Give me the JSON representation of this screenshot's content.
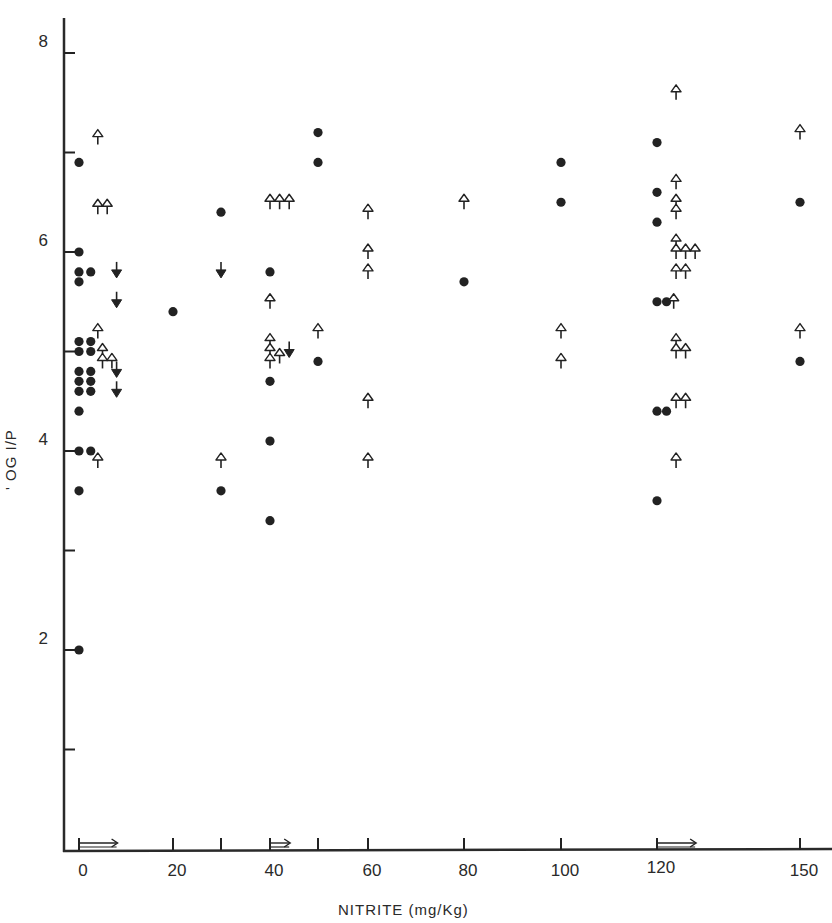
{
  "chart_data": {
    "type": "scatter",
    "title": "",
    "xlabel": "NITRITE (mg/Kg)",
    "ylabel": "' OG I/P",
    "xlim": [
      -3,
      157
    ],
    "ylim": [
      0,
      8.3
    ],
    "grid": false,
    "legend": null,
    "x_ticks": [
      0,
      20,
      30,
      40,
      50,
      60,
      80,
      100,
      120,
      150
    ],
    "x_tick_labels": [
      "0",
      "20",
      "",
      "40",
      "",
      "60",
      "80",
      "100",
      "120",
      "150"
    ],
    "y_ticks": [
      1,
      2,
      3,
      4,
      5,
      6,
      7,
      8
    ],
    "y_tick_labels": [
      "",
      "2",
      "",
      "4",
      "",
      "6",
      "",
      "8"
    ],
    "baseline_arrows": [
      {
        "from": 0,
        "to": 8
      },
      {
        "from": 40,
        "to": 44
      },
      {
        "from": 120,
        "to": 128
      }
    ],
    "series": [
      {
        "name": "filled circles",
        "marker": "filled-circle",
        "points": [
          [
            0,
            6.9
          ],
          [
            0,
            6.0
          ],
          [
            0,
            5.8
          ],
          [
            0,
            5.7
          ],
          [
            0,
            5.1
          ],
          [
            0,
            5.0
          ],
          [
            0,
            4.8
          ],
          [
            0,
            4.7
          ],
          [
            0,
            4.6
          ],
          [
            0,
            4.4
          ],
          [
            0,
            4.0
          ],
          [
            0,
            3.6
          ],
          [
            0,
            2.0
          ],
          [
            2.5,
            5.8
          ],
          [
            2.5,
            5.1
          ],
          [
            2.5,
            5.0
          ],
          [
            2.5,
            4.8
          ],
          [
            2.5,
            4.7
          ],
          [
            2.5,
            4.6
          ],
          [
            2.5,
            4.0
          ],
          [
            20,
            5.4
          ],
          [
            30,
            6.4
          ],
          [
            30,
            3.6
          ],
          [
            40,
            5.8
          ],
          [
            40,
            4.7
          ],
          [
            40,
            4.1
          ],
          [
            40,
            3.3
          ],
          [
            50,
            7.2
          ],
          [
            50,
            6.9
          ],
          [
            50,
            4.9
          ],
          [
            80,
            5.7
          ],
          [
            100,
            6.9
          ],
          [
            100,
            6.5
          ],
          [
            120,
            7.1
          ],
          [
            120,
            6.6
          ],
          [
            120,
            6.3
          ],
          [
            120,
            5.5
          ],
          [
            122,
            5.5
          ],
          [
            120,
            4.4
          ],
          [
            122,
            4.4
          ],
          [
            120,
            3.5
          ],
          [
            150,
            6.5
          ],
          [
            150,
            4.9
          ]
        ]
      },
      {
        "name": "open up-arrows",
        "marker": "open-up-arrow",
        "points": [
          [
            4,
            7.15
          ],
          [
            4,
            6.45
          ],
          [
            6,
            6.45
          ],
          [
            4,
            5.2
          ],
          [
            5,
            5.0
          ],
          [
            5,
            4.9
          ],
          [
            7,
            4.9
          ],
          [
            4,
            3.9
          ],
          [
            30,
            3.9
          ],
          [
            40,
            6.5
          ],
          [
            42,
            6.5
          ],
          [
            44,
            6.5
          ],
          [
            40,
            5.5
          ],
          [
            40,
            5.1
          ],
          [
            40,
            5.0
          ],
          [
            42,
            4.95
          ],
          [
            40,
            4.9
          ],
          [
            50,
            5.2
          ],
          [
            60,
            6.4
          ],
          [
            60,
            6.0
          ],
          [
            60,
            5.8
          ],
          [
            60,
            4.5
          ],
          [
            60,
            3.9
          ],
          [
            80,
            6.5
          ],
          [
            100,
            5.2
          ],
          [
            100,
            4.9
          ],
          [
            124,
            7.6
          ],
          [
            124,
            6.7
          ],
          [
            124,
            6.5
          ],
          [
            124,
            6.4
          ],
          [
            124,
            6.1
          ],
          [
            124,
            6.0
          ],
          [
            126,
            6.0
          ],
          [
            128,
            6.0
          ],
          [
            124,
            5.8
          ],
          [
            126,
            5.8
          ],
          [
            123.5,
            5.5
          ],
          [
            124,
            5.1
          ],
          [
            124,
            5.0
          ],
          [
            126,
            5.0
          ],
          [
            124,
            4.5
          ],
          [
            126,
            4.5
          ],
          [
            124,
            3.9
          ],
          [
            150,
            7.2
          ],
          [
            150,
            5.2
          ]
        ]
      },
      {
        "name": "filled down-arrows",
        "marker": "filled-down-arrow",
        "points": [
          [
            8,
            5.8
          ],
          [
            8,
            5.5
          ],
          [
            8,
            4.8
          ],
          [
            8,
            4.6
          ],
          [
            30,
            5.8
          ],
          [
            44,
            5.0
          ]
        ]
      }
    ]
  }
}
